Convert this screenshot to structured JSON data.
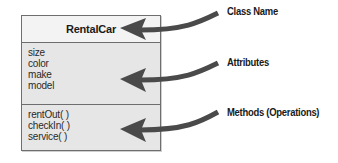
{
  "class_box": {
    "name": "RentalCar",
    "attributes": [
      "size",
      "color",
      "make",
      "model"
    ],
    "methods": [
      "rentOut( )",
      "checkIn( )",
      "service( )"
    ]
  },
  "callouts": [
    {
      "label": "Class Name",
      "target": "class-name-section"
    },
    {
      "label": "Attributes",
      "target": "attributes-section"
    },
    {
      "label": "Methods (Operations)",
      "target": "methods-section"
    }
  ],
  "colors": {
    "arrow": "#4a4a4a",
    "box_fill": "#e6e6e6",
    "header_fill": "#f3f3f3",
    "border": "#6e6e6e"
  }
}
